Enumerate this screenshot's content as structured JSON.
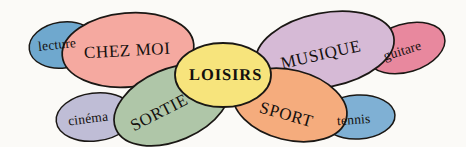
{
  "diagram": {
    "title": "LOISIRS",
    "type": "mind-map",
    "background_color": "#fbfaf7",
    "outline_color": "#1a1714",
    "text_color": "#14100e",
    "center": {
      "label": "LOISIRS",
      "color": "#f7e47c",
      "name": "center-node-loisirs"
    },
    "branches": [
      {
        "label": "CHEZ MOI",
        "color": "#f5a9a0",
        "name": "branch-chez-moi",
        "position": "upper-left",
        "leaf": {
          "label": "lecture",
          "color": "#6fa8ce",
          "name": "leaf-lecture"
        }
      },
      {
        "label": "MUSIQUE",
        "color": "#d6bad6",
        "name": "branch-musique",
        "position": "upper-right",
        "leaf": {
          "label": "guitare",
          "color": "#e8889e",
          "name": "leaf-guitare"
        }
      },
      {
        "label": "SORTIE",
        "color": "#afc6a8",
        "name": "branch-sortie",
        "position": "lower-left",
        "leaf": {
          "label": "cinéma",
          "color": "#bfbdd6",
          "name": "leaf-cinema"
        }
      },
      {
        "label": "SPORT",
        "color": "#f5ac7d",
        "name": "branch-sport",
        "position": "lower-right",
        "leaf": {
          "label": "tennis",
          "color": "#7fb0d4",
          "name": "leaf-tennis"
        }
      }
    ]
  }
}
